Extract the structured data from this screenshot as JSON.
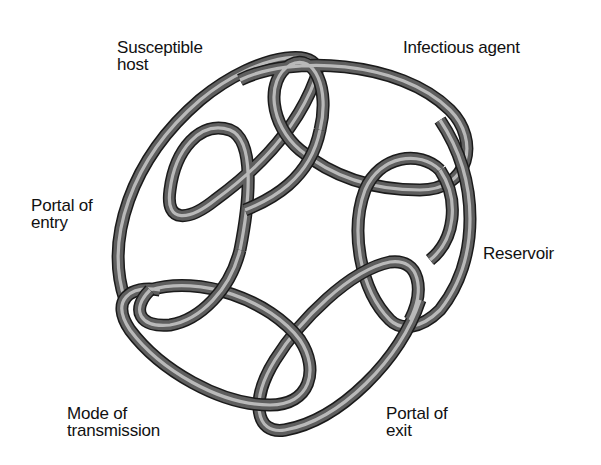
{
  "diagram": {
    "title": "",
    "type": "chain-of-infection",
    "colors": {
      "tube_dark": "#1a1a1a",
      "tube_mid": "#5e5e5e",
      "tube_highlight": "#b9b9b9",
      "background": "#ffffff",
      "text": "#111111"
    },
    "nodes": [
      {
        "id": "infectious-agent",
        "label": "Infectious agent"
      },
      {
        "id": "reservoir",
        "label": "Reservoir"
      },
      {
        "id": "portal-of-exit",
        "label": "Portal of\nexit"
      },
      {
        "id": "mode-of-transmission",
        "label": "Mode of\ntransmission"
      },
      {
        "id": "portal-of-entry",
        "label": "Portal of\nentry"
      },
      {
        "id": "susceptible-host",
        "label": "Susceptible\nhost"
      }
    ],
    "edges": [
      {
        "from": "infectious-agent",
        "to": "reservoir"
      },
      {
        "from": "reservoir",
        "to": "portal-of-exit"
      },
      {
        "from": "portal-of-exit",
        "to": "mode-of-transmission"
      },
      {
        "from": "mode-of-transmission",
        "to": "portal-of-entry"
      },
      {
        "from": "portal-of-entry",
        "to": "susceptible-host"
      },
      {
        "from": "susceptible-host",
        "to": "infectious-agent"
      }
    ]
  }
}
